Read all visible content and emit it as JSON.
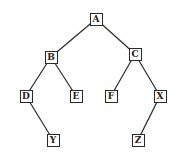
{
  "diagram": {
    "type": "binary-tree",
    "nodes": [
      {
        "id": "A",
        "label": "A",
        "x": 96,
        "y": 19
      },
      {
        "id": "B",
        "label": "B",
        "x": 51,
        "y": 57
      },
      {
        "id": "C",
        "label": "C",
        "x": 135,
        "y": 54
      },
      {
        "id": "D",
        "label": "D",
        "x": 26,
        "y": 96
      },
      {
        "id": "E",
        "label": "E",
        "x": 76,
        "y": 96
      },
      {
        "id": "F",
        "label": "F",
        "x": 111,
        "y": 96
      },
      {
        "id": "X",
        "label": "X",
        "x": 160,
        "y": 96
      },
      {
        "id": "Y",
        "label": "Y",
        "x": 53,
        "y": 140
      },
      {
        "id": "Z",
        "label": "Z",
        "x": 138,
        "y": 140
      }
    ],
    "edges": [
      [
        "A",
        "B"
      ],
      [
        "A",
        "C"
      ],
      [
        "B",
        "D"
      ],
      [
        "B",
        "E"
      ],
      [
        "C",
        "F"
      ],
      [
        "C",
        "X"
      ],
      [
        "D",
        "Y"
      ],
      [
        "X",
        "Z"
      ]
    ]
  }
}
